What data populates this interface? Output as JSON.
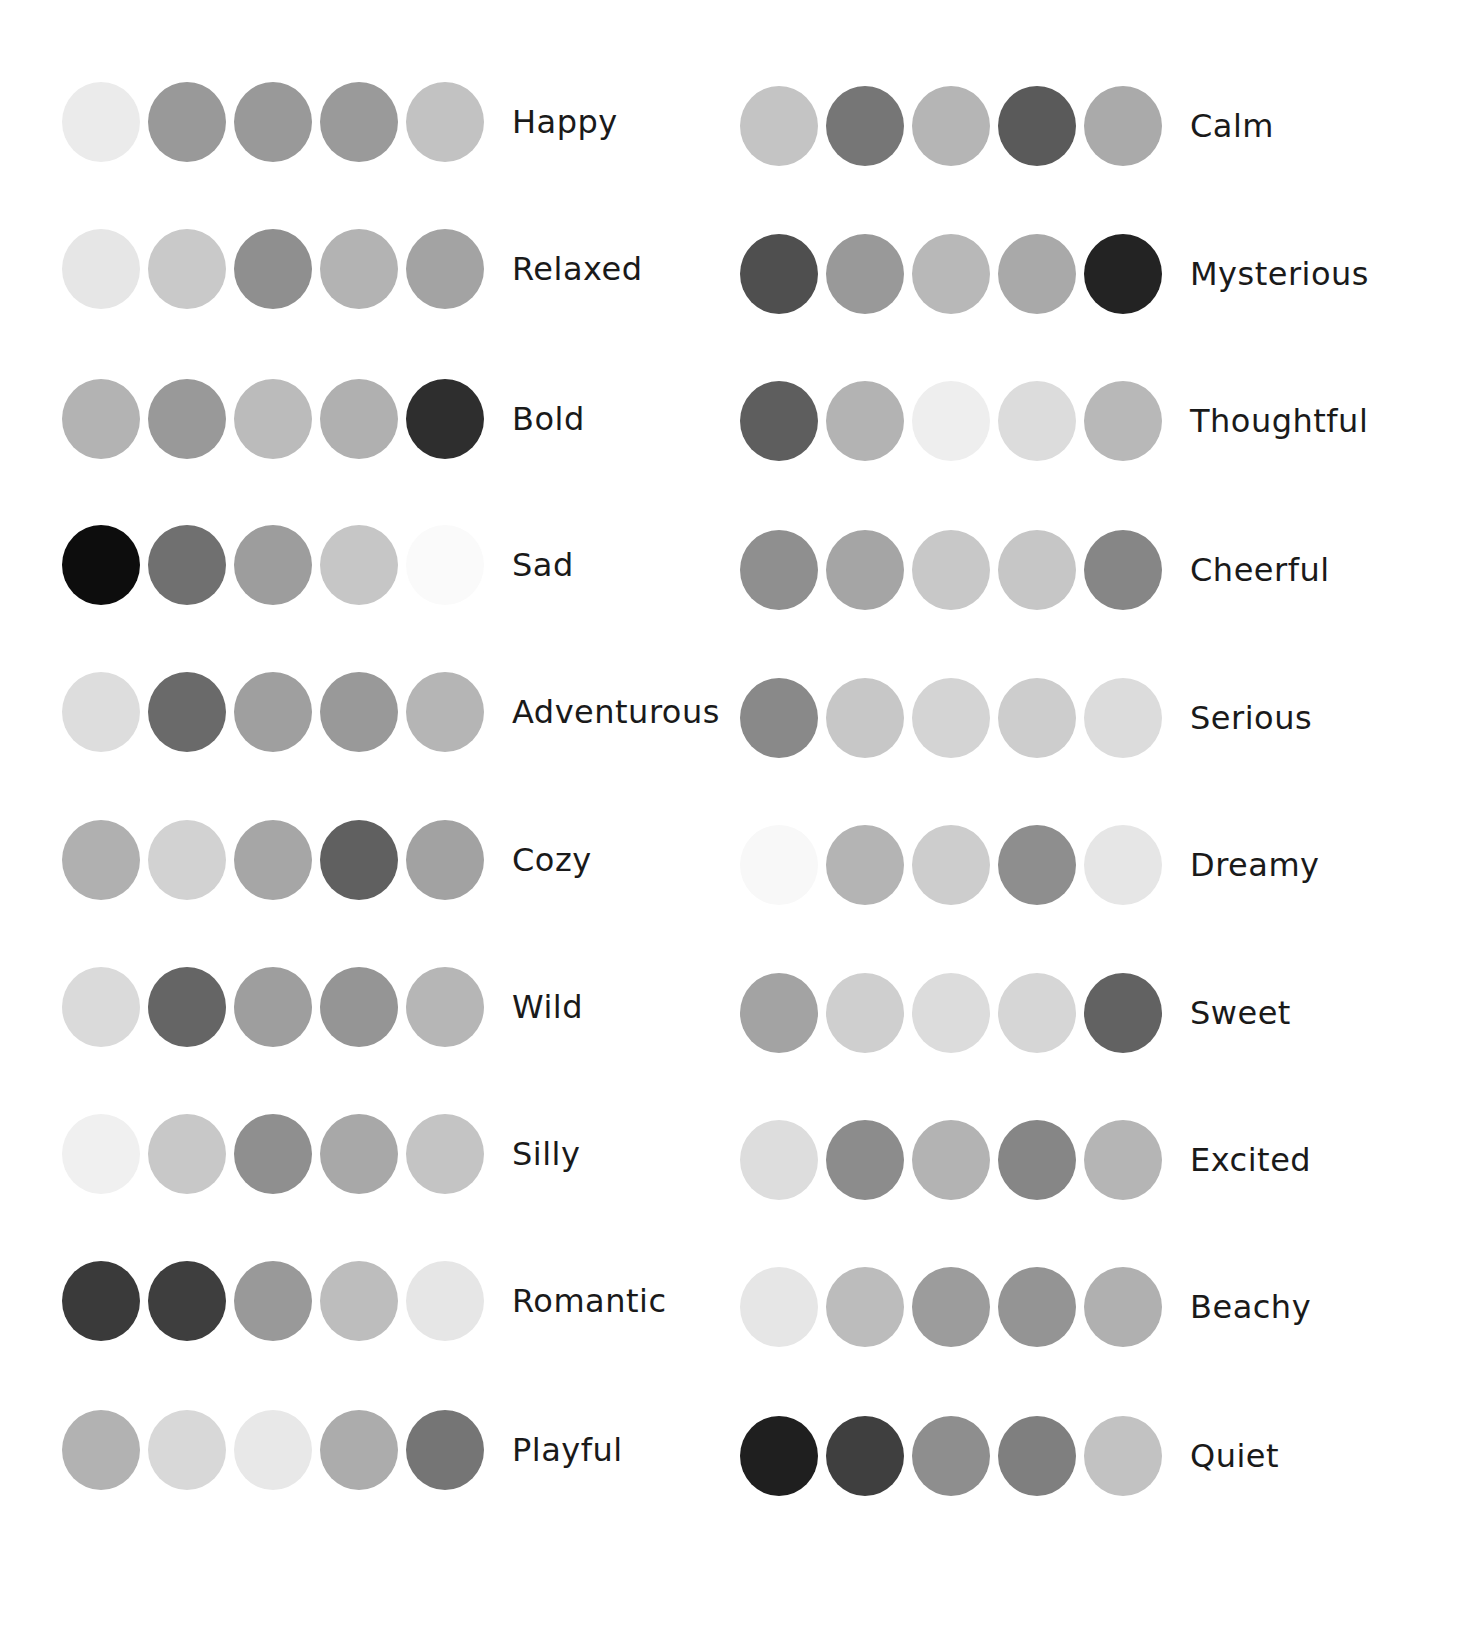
{
  "palettes": {
    "left": [
      {
        "label": "Happy",
        "colors": [
          "#ebebeb",
          "#999999",
          "#999999",
          "#9a9a9a",
          "#c2c2c2"
        ]
      },
      {
        "label": "Relaxed",
        "colors": [
          "#e6e6e6",
          "#c9c9c9",
          "#8f8f8f",
          "#b3b3b3",
          "#a3a3a3"
        ]
      },
      {
        "label": "Bold",
        "colors": [
          "#b3b3b3",
          "#999999",
          "#bbbbbb",
          "#b0b0b0",
          "#2e2e2e"
        ]
      },
      {
        "label": "Sad",
        "colors": [
          "#0d0d0d",
          "#707070",
          "#9d9d9d",
          "#c6c6c6",
          "#fafafa"
        ]
      },
      {
        "label": "Adventurous",
        "colors": [
          "#dddddd",
          "#6a6a6a",
          "#9f9f9f",
          "#999999",
          "#b5b5b5"
        ]
      },
      {
        "label": "Cozy",
        "colors": [
          "#b0b0b0",
          "#d2d2d2",
          "#a6a6a6",
          "#606060",
          "#a2a2a2"
        ]
      },
      {
        "label": "Wild",
        "colors": [
          "#dadada",
          "#656565",
          "#9e9e9e",
          "#959595",
          "#b6b6b6"
        ]
      },
      {
        "label": "Silly",
        "colors": [
          "#f0f0f0",
          "#c8c8c8",
          "#8f8f8f",
          "#a8a8a8",
          "#c4c4c4"
        ]
      },
      {
        "label": "Romantic",
        "colors": [
          "#3a3a3a",
          "#3e3e3e",
          "#999999",
          "#bdbdbd",
          "#e6e6e6"
        ]
      },
      {
        "label": "Playful",
        "colors": [
          "#b2b2b2",
          "#d8d8d8",
          "#e8e8e8",
          "#acacac",
          "#757575"
        ]
      }
    ],
    "right": [
      {
        "label": "Calm",
        "colors": [
          "#c4c4c4",
          "#767676",
          "#b5b5b5",
          "#5a5a5a",
          "#aaaaaa"
        ]
      },
      {
        "label": "Mysterious",
        "colors": [
          "#4f4f4f",
          "#999999",
          "#b8b8b8",
          "#a9a9a9",
          "#232323"
        ]
      },
      {
        "label": "Thoughtful",
        "colors": [
          "#5e5e5e",
          "#b3b3b3",
          "#eeeeee",
          "#dcdcdc",
          "#b8b8b8"
        ]
      },
      {
        "label": "Cheerful",
        "colors": [
          "#8f8f8f",
          "#a5a5a5",
          "#c8c8c8",
          "#c6c6c6",
          "#868686"
        ]
      },
      {
        "label": "Serious",
        "colors": [
          "#898989",
          "#c7c7c7",
          "#d4d4d4",
          "#cdcdcd",
          "#dcdcdc"
        ]
      },
      {
        "label": "Dreamy",
        "colors": [
          "#f8f8f8",
          "#b4b4b4",
          "#cdcdcd",
          "#8e8e8e",
          "#e6e6e6"
        ]
      },
      {
        "label": "Sweet",
        "colors": [
          "#a3a3a3",
          "#cfcfcf",
          "#dcdcdc",
          "#d6d6d6",
          "#626262"
        ]
      },
      {
        "label": "Excited",
        "colors": [
          "#dddddd",
          "#8c8c8c",
          "#b3b3b3",
          "#868686",
          "#b5b5b5"
        ]
      },
      {
        "label": "Beachy",
        "colors": [
          "#e6e6e6",
          "#bcbcbc",
          "#9c9c9c",
          "#949494",
          "#b0b0b0"
        ]
      },
      {
        "label": "Quiet",
        "colors": [
          "#1f1f1f",
          "#3f3f3f",
          "#8e8e8e",
          "#7f7f7f",
          "#c2c2c2"
        ]
      }
    ]
  },
  "layout": {
    "left_row_tops": [
      82,
      229,
      379,
      525,
      672,
      820,
      967,
      1114,
      1261,
      1410
    ],
    "right_row_tops": [
      86,
      234,
      381,
      530,
      678,
      825,
      973,
      1120,
      1267,
      1416
    ]
  }
}
